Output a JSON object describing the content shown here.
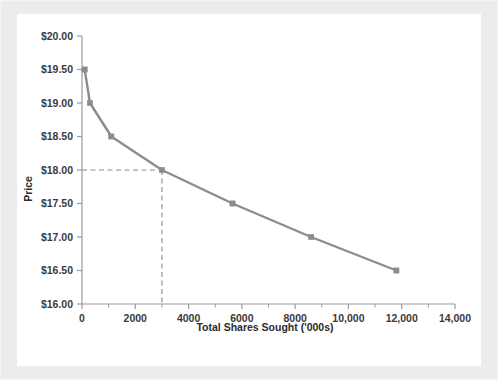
{
  "chart_data": {
    "type": "line",
    "title": "",
    "xlabel": "Total Shares Sought ('000s)",
    "ylabel": "Price",
    "xlim": [
      0,
      14000
    ],
    "ylim": [
      16.0,
      20.0
    ],
    "xticks": [
      0,
      2000,
      4000,
      6000,
      8000,
      10000,
      12000,
      14000
    ],
    "xticklabels": [
      "0",
      "2000",
      "4000",
      "6000",
      "8000",
      "10,000",
      "12,000",
      "14,000"
    ],
    "yticks": [
      16.0,
      16.5,
      17.0,
      17.5,
      18.0,
      18.5,
      19.0,
      19.5,
      20.0
    ],
    "yticklabels": [
      "$16.00",
      "$16.50",
      "$17.00",
      "$17.50",
      "$18.00",
      "$18.50",
      "$19.00",
      "$19.50",
      "$20.00"
    ],
    "grid": false,
    "legend": null,
    "series": [
      {
        "name": "Demand schedule",
        "marker": "square",
        "color": "#8c8c8c",
        "x": [
          100,
          300,
          1100,
          3000,
          5650,
          8600,
          11800
        ],
        "y": [
          19.5,
          19.0,
          18.5,
          18.0,
          17.5,
          17.0,
          16.5
        ]
      }
    ],
    "annotations": [
      {
        "name": "clearing-price-guideline",
        "type": "dashed-crosshair",
        "x": 3000,
        "y": 18.0,
        "color": "#8c8c8c"
      }
    ]
  },
  "axes": {
    "y_label": "Price",
    "x_label": "Total Shares Sought ('000s)"
  },
  "colors": {
    "line": "#8c8c8c",
    "marker": "#8c8c8c",
    "axis": "#9a9a9a",
    "guide": "#8c8c8c",
    "frame": "#ececed",
    "plot_bg": "#ffffff",
    "text": "#2b2b2b"
  }
}
